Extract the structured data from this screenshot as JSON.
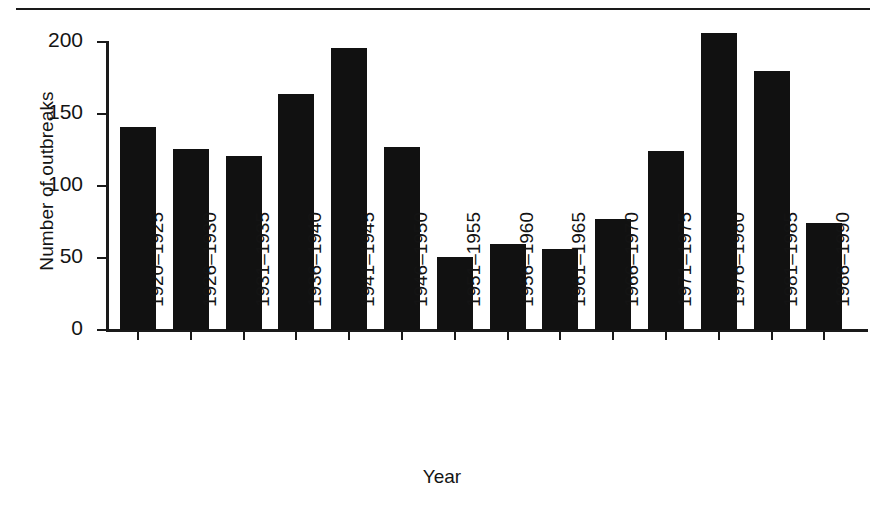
{
  "chart_data": {
    "type": "bar",
    "title": "",
    "xlabel": "Year",
    "ylabel": "Number of outbreaks",
    "ylim": [
      0,
      200
    ],
    "yticks": [
      0,
      50,
      100,
      150,
      200
    ],
    "grid": false,
    "legend": null,
    "categories": [
      "1920–1925",
      "1926–1930",
      "1931–1935",
      "1936–1940",
      "1941–1945",
      "1946–1950",
      "1951–1955",
      "1956–1960",
      "1961–1965",
      "1966–1970",
      "1971–1975",
      "1976–1980",
      "1981–1985",
      "1986–1990"
    ],
    "values": [
      141,
      126,
      121,
      164,
      196,
      127,
      51,
      60,
      56,
      77,
      124,
      206,
      180,
      74
    ],
    "bar_color": "#111111",
    "axis_color": "#1a1a1a",
    "background_color": "#ffffff"
  },
  "figure": {
    "top_rule_present": true
  }
}
